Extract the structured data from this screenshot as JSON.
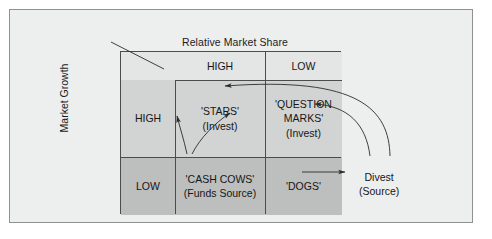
{
  "diagram": {
    "type": "bcg-growth-share-matrix",
    "top_axis_title": "Relative Market Share",
    "left_axis_title": "Market Growth",
    "column_headers": [
      "HIGH",
      "LOW"
    ],
    "row_headers": [
      "HIGH",
      "LOW"
    ],
    "quadrants": [
      {
        "id": "stars",
        "row": "HIGH",
        "column": "HIGH",
        "title": "'STARS'",
        "subtitle": "(Invest)"
      },
      {
        "id": "question-marks",
        "row": "HIGH",
        "column": "LOW",
        "title": "'QUESTION",
        "title_line2": "MARKS'",
        "subtitle": "(Invest)"
      },
      {
        "id": "cash-cows",
        "row": "LOW",
        "column": "HIGH",
        "title": "'CASH COWS'",
        "subtitle": "(Funds Source)"
      },
      {
        "id": "dogs",
        "row": "LOW",
        "column": "LOW",
        "title": "'DOGS'",
        "subtitle": ""
      }
    ],
    "external_label": {
      "id": "divest",
      "title": "Divest",
      "subtitle": "(Source)"
    },
    "arrows": [
      {
        "id": "cash-cows-to-stars",
        "from": "cash-cows",
        "to": "stars"
      },
      {
        "id": "cash-cows-to-question-marks",
        "from": "cash-cows",
        "to": "question-marks"
      },
      {
        "id": "dogs-to-divest",
        "from": "dogs",
        "to": "divest"
      },
      {
        "id": "divest-to-stars",
        "from": "divest",
        "to": "stars"
      },
      {
        "id": "divest-to-question-marks",
        "from": "divest",
        "to": "question-marks"
      }
    ],
    "colors": {
      "page_background": "#ffffff",
      "card_background": "#edeeee",
      "card_border": "#8e9091",
      "grid_line": "#4c4c4c",
      "header_fill": "#e4e5e5",
      "high_row_fill": "#d2d3d3",
      "low_row_fill": "#bdbebe",
      "text": "#161616"
    }
  }
}
